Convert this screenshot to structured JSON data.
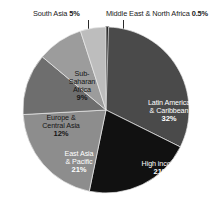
{
  "chart_data": {
    "type": "pie",
    "title": "",
    "subtitle": "",
    "xlabel": "",
    "ylabel": "",
    "legend_position": "none",
    "grid": false,
    "units": "percent",
    "total": 100.5,
    "start_angle_deg": 0,
    "direction": "clockwise",
    "categories": [
      "Middle East & North Africa",
      "Latin America & Caribbean",
      "High income",
      "East Asia & Pacific",
      "Europe & Central Asia",
      "Sub-Saharan Africa",
      "South Asia"
    ],
    "values": [
      0.5,
      32,
      21,
      21,
      12,
      9,
      5
    ],
    "slices": [
      {
        "name": "Middle East & North Africa",
        "value": 0.5,
        "percent_text": "0.5%",
        "label_text": "Middle East & North Africa 0.5%",
        "color": "#2b2b2b",
        "label_placement": "external-top-right",
        "text_color": "#1a1a1a"
      },
      {
        "name": "Latin America & Caribbean",
        "value": 32,
        "percent_text": "32%",
        "label_line1": "Latin America",
        "label_line2": "& Caribbean",
        "color": "#4a4a4a",
        "label_placement": "inside",
        "text_color": "#ffffff"
      },
      {
        "name": "High income",
        "value": 21,
        "percent_text": "21%",
        "label_line1": "High income",
        "label_line2": "",
        "color": "#111111",
        "label_placement": "inside",
        "text_color": "#ffffff"
      },
      {
        "name": "East Asia & Pacific",
        "value": 21,
        "percent_text": "21%",
        "label_line1": "East Asia",
        "label_line2": "& Pacific",
        "color": "#8d8d8d",
        "label_placement": "inside",
        "text_color": "#ffffff"
      },
      {
        "name": "Europe & Central Asia",
        "value": 12,
        "percent_text": "12%",
        "label_line1": "Europe &",
        "label_line2": "Central Asia",
        "color": "#6e6e6e",
        "label_placement": "inside",
        "text_color": "#151515"
      },
      {
        "name": "Sub-Saharan Africa",
        "value": 9,
        "percent_text": "9%",
        "label_line1": "Sub-",
        "label_line2": "Saharan",
        "label_line3": "Africa",
        "color": "#9c9c9c",
        "label_placement": "inside",
        "text_color": "#151515"
      },
      {
        "name": "South Asia",
        "value": 5,
        "percent_text": "5%",
        "label_text": "South Asia 5%",
        "color": "#bdbdbd",
        "label_placement": "external-top-left",
        "text_color": "#1a1a1a"
      }
    ]
  },
  "labels": {
    "south_asia": {
      "name": "South Asia",
      "percent": "5%"
    },
    "mena": {
      "name": "Middle East & North Africa",
      "percent": "0.5%"
    },
    "latin": {
      "line1": "Latin America",
      "line2": "& Caribbean",
      "percent": "32%"
    },
    "high_income": {
      "line1": "High income",
      "percent": "21%"
    },
    "east_asia": {
      "line1": "East Asia",
      "line2": "& Pacific",
      "percent": "21%"
    },
    "europe": {
      "line1": "Europe &",
      "line2": "Central Asia",
      "percent": "12%"
    },
    "ssa": {
      "line1": "Sub-",
      "line2": "Saharan",
      "line3": "Africa",
      "percent": "9%"
    }
  }
}
